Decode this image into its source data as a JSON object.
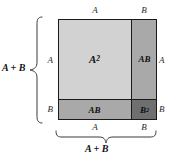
{
  "diagram": {
    "colors": {
      "a_squared_fill": "#d2d2d2",
      "ab_fill": "#a9a9a9",
      "b_squared_fill": "#6f6f6f",
      "outline": "#1a1a1a",
      "label_text": "#111111",
      "brace_stroke": "#3a3a3a",
      "background": "#ffffff"
    },
    "regions": [
      {
        "name": "a-squared",
        "base": "A",
        "exponent": "2",
        "label": "A2"
      },
      {
        "name": "ab-right",
        "base": "AB",
        "exponent": "",
        "label": "AB"
      },
      {
        "name": "ab-bottom",
        "base": "AB",
        "exponent": "",
        "label": "AB"
      },
      {
        "name": "b-squared",
        "base": "B",
        "exponent": "2",
        "label": "B2"
      }
    ],
    "edge_labels": {
      "top_left": "A",
      "top_right": "B",
      "right_upper": "A",
      "right_lower": "B",
      "bottom_left": "A",
      "bottom_right": "B",
      "left_upper": "A",
      "left_lower": "B"
    },
    "braces": {
      "left_sum": "A + B",
      "bottom_sum": "A + B"
    }
  }
}
